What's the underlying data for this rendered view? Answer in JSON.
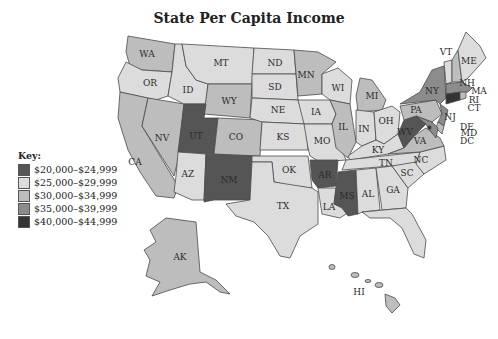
{
  "title": "State Per Capita Income",
  "legend": {
    "label": "Key:",
    "items": [
      {
        "range": "$20,000–$24,999",
        "color": "#555555"
      },
      {
        "range": "$25,000–$29,999",
        "color": "#dcdcdc"
      },
      {
        "range": "$30,000–$34,999",
        "color": "#bdbdbd"
      },
      {
        "range": "$35,000–$39,999",
        "color": "#8c8c8c"
      },
      {
        "range": "$40,000–$44,999",
        "color": "#333333"
      }
    ]
  },
  "states": {
    "WA": {
      "label": "WA",
      "bracket": 2
    },
    "OR": {
      "label": "OR",
      "bracket": 1
    },
    "CA": {
      "label": "CA",
      "bracket": 2
    },
    "NV": {
      "label": "NV",
      "bracket": 2
    },
    "ID": {
      "label": "ID",
      "bracket": 1
    },
    "MT": {
      "label": "MT",
      "bracket": 1
    },
    "WY": {
      "label": "WY",
      "bracket": 2
    },
    "UT": {
      "label": "UT",
      "bracket": 0
    },
    "CO": {
      "label": "CO",
      "bracket": 2
    },
    "AZ": {
      "label": "AZ",
      "bracket": 1
    },
    "NM": {
      "label": "NM",
      "bracket": 0
    },
    "ND": {
      "label": "ND",
      "bracket": 1
    },
    "SD": {
      "label": "SD",
      "bracket": 1
    },
    "NE": {
      "label": "NE",
      "bracket": 1
    },
    "KS": {
      "label": "KS",
      "bracket": 1
    },
    "OK": {
      "label": "OK",
      "bracket": 1
    },
    "TX": {
      "label": "TX",
      "bracket": 1
    },
    "MN": {
      "label": "MN",
      "bracket": 2
    },
    "IA": {
      "label": "IA",
      "bracket": 1
    },
    "MO": {
      "label": "MO",
      "bracket": 1
    },
    "AR": {
      "label": "AR",
      "bracket": 0
    },
    "LA": {
      "label": "LA",
      "bracket": 1
    },
    "WI": {
      "label": "WI",
      "bracket": 1
    },
    "IL": {
      "label": "IL",
      "bracket": 2
    },
    "MI": {
      "label": "MI",
      "bracket": 2
    },
    "IN": {
      "label": "IN",
      "bracket": 1
    },
    "OH": {
      "label": "OH",
      "bracket": 1
    },
    "KY": {
      "label": "KY",
      "bracket": 1
    },
    "TN": {
      "label": "TN",
      "bracket": 1
    },
    "MS": {
      "label": "MS",
      "bracket": 0
    },
    "AL": {
      "label": "AL",
      "bracket": 1
    },
    "GA": {
      "label": "GA",
      "bracket": 1
    },
    "FL": {
      "label": "FL",
      "bracket": 1
    },
    "SC": {
      "label": "SC",
      "bracket": 1
    },
    "NC": {
      "label": "NC",
      "bracket": 1
    },
    "VA": {
      "label": "VA",
      "bracket": 2
    },
    "WV": {
      "label": "WV",
      "bracket": 0
    },
    "PA": {
      "label": "PA",
      "bracket": 2
    },
    "NY": {
      "label": "NY",
      "bracket": 3
    },
    "VT": {
      "label": "VT",
      "bracket": 1
    },
    "NH": {
      "label": "NH",
      "bracket": 2
    },
    "ME": {
      "label": "ME",
      "bracket": 1
    },
    "MA": {
      "label": "MA",
      "bracket": 3
    },
    "RI": {
      "label": "RI",
      "bracket": 2
    },
    "CT": {
      "label": "CT",
      "bracket": 4
    },
    "NJ": {
      "label": "NJ",
      "bracket": 3
    },
    "DE": {
      "label": "DE",
      "bracket": 2
    },
    "MD": {
      "label": "MD",
      "bracket": 3
    },
    "DC": {
      "label": "DC",
      "bracket": 4
    },
    "AK": {
      "label": "AK",
      "bracket": 2
    },
    "HI": {
      "label": "HI",
      "bracket": 2
    }
  }
}
